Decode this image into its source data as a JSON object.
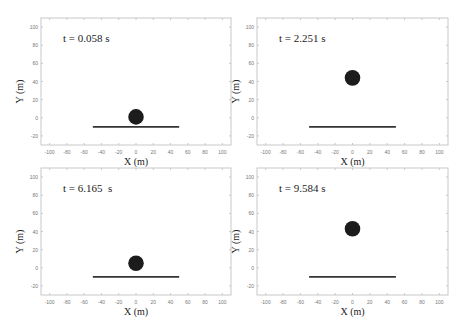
{
  "chart_data": [
    {
      "type": "scatter",
      "title": "t = 0.058 s",
      "xlabel": "X (m)",
      "ylabel": "Y (m)",
      "xlim": [
        -110,
        110
      ],
      "ylim": [
        -30,
        110
      ],
      "xticks": [
        -100,
        -80,
        -60,
        -40,
        -20,
        0,
        20,
        40,
        60,
        80,
        100
      ],
      "yticks": [
        -20,
        0,
        20,
        40,
        60,
        80,
        100
      ],
      "ball": {
        "x": 0,
        "y": 1,
        "radius": 9
      },
      "ground": {
        "x0": -50,
        "x1": 50,
        "y": -10
      }
    },
    {
      "type": "scatter",
      "title": "t = 2.251 s",
      "xlabel": "X (m)",
      "ylabel": "Y (m)",
      "xlim": [
        -110,
        110
      ],
      "ylim": [
        -30,
        110
      ],
      "xticks": [
        -100,
        -80,
        -60,
        -40,
        -20,
        0,
        20,
        40,
        60,
        80,
        100
      ],
      "yticks": [
        -20,
        0,
        20,
        40,
        60,
        80,
        100
      ],
      "ball": {
        "x": 0,
        "y": 44,
        "radius": 9
      },
      "ground": {
        "x0": -50,
        "x1": 50,
        "y": -10
      }
    },
    {
      "type": "scatter",
      "title": "t = 6.165  s",
      "xlabel": "X (m)",
      "ylabel": "Y (m)",
      "xlim": [
        -110,
        110
      ],
      "ylim": [
        -30,
        110
      ],
      "xticks": [
        -100,
        -80,
        -60,
        -40,
        -20,
        0,
        20,
        40,
        60,
        80,
        100
      ],
      "yticks": [
        -20,
        0,
        20,
        40,
        60,
        80,
        100
      ],
      "ball": {
        "x": 0,
        "y": 5,
        "radius": 9
      },
      "ground": {
        "x0": -50,
        "x1": 50,
        "y": -10
      }
    },
    {
      "type": "scatter",
      "title": "t = 9.584 s",
      "xlabel": "X (m)",
      "ylabel": "Y (m)",
      "xlim": [
        -110,
        110
      ],
      "ylim": [
        -30,
        110
      ],
      "xticks": [
        -100,
        -80,
        -60,
        -40,
        -20,
        0,
        20,
        40,
        60,
        80,
        100
      ],
      "yticks": [
        -20,
        0,
        20,
        40,
        60,
        80,
        100
      ],
      "ball": {
        "x": 0,
        "y": 43,
        "radius": 9
      },
      "ground": {
        "x0": -50,
        "x1": 50,
        "y": -10
      }
    }
  ],
  "panels": [
    {
      "title": "t = 0.058 s",
      "xlabel": "X (m)",
      "ylabel": "Y (m)"
    },
    {
      "title": "t = 2.251 s",
      "xlabel": "X (m)",
      "ylabel": "Y (m)"
    },
    {
      "title": "t = 6.165  s",
      "xlabel": "X (m)",
      "ylabel": "Y (m)"
    },
    {
      "title": "t = 9.584 s",
      "xlabel": "X (m)",
      "ylabel": "Y (m)"
    }
  ],
  "colors": {
    "ball": "#1c1c1c",
    "ground": "#333333",
    "axes": "#c8c8c8",
    "ticklabel": "#777777",
    "text": "#222222"
  }
}
